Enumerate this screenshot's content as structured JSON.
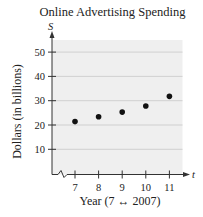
{
  "chart_data": {
    "type": "scatter",
    "title": "Online Advertising Spending",
    "xlabel": "Year (7 ↔ 2007)",
    "ylabel": "Dollars (in billions)",
    "x_axis_variable": "t",
    "y_axis_variable": "S",
    "x_ticks": [
      7,
      8,
      9,
      10,
      11
    ],
    "y_ticks": [
      10,
      20,
      30,
      40,
      50
    ],
    "xlim": [
      6,
      11.5
    ],
    "ylim": [
      0,
      55
    ],
    "grid": "horizontal",
    "axis_break": "x-axis between origin and 7",
    "x": [
      7,
      8,
      9,
      10,
      11
    ],
    "y": [
      21.4,
      23.4,
      25.3,
      27.8,
      31.8
    ],
    "points": [
      {
        "x": 7,
        "y": 21.4
      },
      {
        "x": 8,
        "y": 23.4
      },
      {
        "x": 9,
        "y": 25.3
      },
      {
        "x": 10,
        "y": 27.8
      },
      {
        "x": 11,
        "y": 31.8
      }
    ]
  },
  "labels": {
    "title": "Online Advertising Spending",
    "xlabel": "Year (7 ↔ 2007)",
    "ylabel": "Dollars (in billions)",
    "x_var": "t",
    "y_var": "S"
  },
  "colors": {
    "plot_background": "#efefef",
    "gridline": "#c8c8c8",
    "axis": "#333333",
    "point": "#111111"
  }
}
